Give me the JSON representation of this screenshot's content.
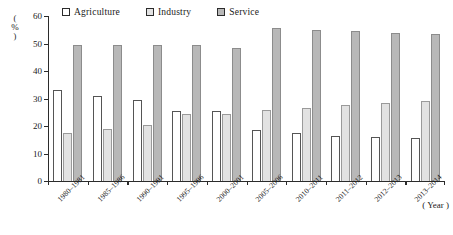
{
  "chart_data": {
    "type": "bar",
    "title": "",
    "subtitle": "",
    "xlabel": "( Year )",
    "ylabel": "( % )",
    "ylim": [
      0,
      60
    ],
    "yticks": [
      0,
      10,
      20,
      30,
      40,
      50,
      60
    ],
    "grid": false,
    "legend_position": "top",
    "categories": [
      "1980–1981",
      "1985–1986",
      "1990–1991",
      "1995–1996",
      "2000–2001",
      "2005–2006",
      "2010–2011",
      "2011–2012",
      "2012–2013",
      "2013–2014"
    ],
    "series": [
      {
        "name": "Agriculture",
        "color": "#ffffff",
        "values": [
          33,
          31,
          29.5,
          25.5,
          25.5,
          18.5,
          17.5,
          16.5,
          16,
          15.5
        ]
      },
      {
        "name": "Industry",
        "color": "#e2e2e2",
        "values": [
          17.5,
          19,
          20.5,
          24.5,
          24.5,
          26,
          26.5,
          27.5,
          28.5,
          29
        ]
      },
      {
        "name": "Service",
        "color": "#b8b8b8",
        "values": [
          49.5,
          49.5,
          49.5,
          49.5,
          48.5,
          55.5,
          54.8,
          54.5,
          54,
          53.5
        ]
      }
    ]
  },
  "axis": {
    "y_unit_open": "(",
    "y_unit_symbol": "%",
    "y_unit_close": ")"
  }
}
